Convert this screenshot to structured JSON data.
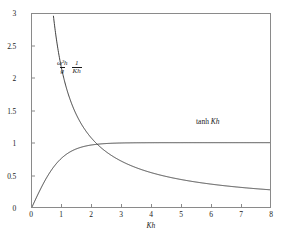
{
  "figure": {
    "background_color": "#ffffff",
    "axis_color": "#8a8a8a",
    "curve_color": "#2b2b2b"
  },
  "axes": {
    "x": {
      "label": "Kh",
      "min": 0,
      "max": 8,
      "ticks": [
        0,
        1,
        2,
        3,
        4,
        5,
        6,
        7,
        8
      ],
      "tick_labels": [
        "0",
        "1",
        "2",
        "3",
        "4",
        "5",
        "6",
        "7",
        "8"
      ]
    },
    "y": {
      "label": "",
      "min": 0,
      "max": 3,
      "ticks": [
        0,
        0.5,
        1,
        1.5,
        2,
        2.5,
        3
      ],
      "tick_labels": [
        "0",
        "0.5",
        "1",
        "1.5",
        "2",
        "2.5",
        "3"
      ]
    }
  },
  "annotations": {
    "fraction": {
      "numerator_1": "ω²h",
      "denominator_1": "g",
      "numerator_2": "1",
      "denominator_2": "Kh"
    },
    "tanh": {
      "function": "tanh",
      "argument": "Kh"
    }
  },
  "chart_data": {
    "type": "line",
    "title": "",
    "xlabel": "Kh",
    "ylabel": "",
    "xlim": [
      0,
      8
    ],
    "ylim": [
      0,
      3
    ],
    "grid": false,
    "legend": "inline-annotations",
    "x": [
      0,
      0.1,
      0.2,
      0.3,
      0.4,
      0.5,
      0.6,
      0.7,
      0.8,
      0.9,
      1.0,
      1.2,
      1.4,
      1.6,
      1.8,
      2.0,
      2.2,
      2.4,
      2.6,
      2.8,
      3.0,
      3.5,
      4.0,
      4.5,
      5.0,
      5.5,
      6.0,
      6.5,
      7.0,
      7.5,
      8.0
    ],
    "series": [
      {
        "name": "tanh Kh",
        "label": "tanh Kh",
        "values": [
          0.0,
          0.0997,
          0.1974,
          0.2913,
          0.3799,
          0.4621,
          0.537,
          0.6044,
          0.664,
          0.7163,
          0.7616,
          0.8337,
          0.8854,
          0.9217,
          0.9468,
          0.964,
          0.9757,
          0.9837,
          0.989,
          0.9926,
          0.9951,
          0.9982,
          0.9993,
          0.9998,
          0.9999,
          1.0,
          1.0,
          1.0,
          1.0,
          1.0,
          1.0
        ],
        "asymptote": 1.0
      },
      {
        "name": "omega2h_over_g_times_1_over_Kh",
        "label": "(ω²h/g)(1/Kh)",
        "values": [
          1.0,
          0.9967,
          0.9868,
          0.9709,
          0.9497,
          0.9242,
          0.895,
          0.8634,
          0.83,
          0.7959,
          0.7616,
          0.6948,
          0.6324,
          0.5761,
          0.526,
          0.482,
          0.4435,
          0.4099,
          0.3804,
          0.3545,
          0.3317,
          0.2852,
          0.2498,
          0.2222,
          0.2,
          0.1818,
          0.1667,
          0.1538,
          0.1429,
          0.1333,
          0.125
        ],
        "note": "Plotted branch rises above the top of the axis near Kh < 0.57; visible value at Kh = 8 is approximately 0.27"
      }
    ],
    "intersection": {
      "x": 2.06,
      "y": 0.97
    }
  }
}
